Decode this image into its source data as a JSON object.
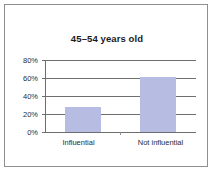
{
  "chart_data": {
    "type": "bar",
    "title": "45–54 years old",
    "categories": [
      "Influential",
      "Not influential"
    ],
    "values": [
      28,
      61
    ],
    "value_labels": [
      "28%",
      "61%"
    ],
    "xlabel": "",
    "ylabel": "",
    "ylim": [
      0,
      80
    ],
    "ytick_values": [
      0,
      20,
      40,
      60,
      80
    ],
    "ytick_labels": [
      "0%",
      "20%",
      "40%",
      "60%",
      "80%"
    ],
    "grid": true,
    "legend": false,
    "bar_color": "#b6bce2",
    "axis_color": "#6e6e6e",
    "border_color": "#8e8e8e",
    "background_color": "#ffffff",
    "text_color": "#2b2b2b"
  }
}
